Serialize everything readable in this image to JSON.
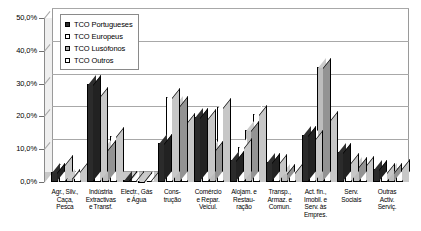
{
  "chart_data": {
    "type": "bar",
    "title": "",
    "xlabel": "",
    "ylabel": "",
    "ylim": [
      0,
      50
    ],
    "ytick_labels": [
      "50,0%",
      "40,0%",
      "30,0%",
      "20,0%",
      "10,0%",
      "0,0%"
    ],
    "ytick_values": [
      50,
      40,
      30,
      20,
      10,
      0
    ],
    "grid": true,
    "legend_position": "upper-left-inside",
    "style": "3d-clustered-column",
    "categories": [
      "Agr., Silv., Caça, Pesca",
      "Indústria Extractivas e Transf.",
      "Electr., Gás e Água",
      "Cons-trução",
      "Comércio e Repar. Veicul.",
      "Alojam. e Restau-ração",
      "Transp., Armaz. e Comun.",
      "Act. fin., Imobil. e Serv. às Empres.",
      "Serv. Sociais",
      "Outras Activ. Serviç."
    ],
    "category_lines": [
      [
        "Agr., Silv.,",
        "Caça,",
        "Pesca"
      ],
      [
        "Indústria",
        "Extractivas",
        "e Transf."
      ],
      [
        "Electr., Gás",
        "e Água"
      ],
      [
        "Cons-",
        "trução"
      ],
      [
        "Comércio",
        "e Repar.",
        "Veicul."
      ],
      [
        "Alojam. e",
        "Restau-",
        "ração"
      ],
      [
        "Transp.,",
        "Armaz. e",
        "Comun."
      ],
      [
        "Act. fin.,",
        "Imobil. e",
        "Serv. às",
        "Empres."
      ],
      [
        "Serv.",
        "Sociais"
      ],
      [
        "Outras",
        "Activ.",
        "Serviç."
      ]
    ],
    "series": [
      {
        "name": "TCO Portugueses",
        "color": "#2b2b2b",
        "values": [
          3.2,
          30.0,
          0.6,
          11.8,
          19.8,
          6.8,
          6.0,
          14.2,
          9.0,
          4.0
        ]
      },
      {
        "name": "TCO Europeus",
        "color": "#ffffff",
        "values": [
          5.6,
          26.2,
          0.5,
          25.8,
          19.6,
          10.8,
          5.8,
          13.0,
          6.0,
          3.2
        ]
      },
      {
        "name": "TCO Lusófonos",
        "color": "#bdbdbd",
        "values": [
          1.2,
          10.2,
          0.4,
          23.4,
          9.8,
          15.8,
          2.8,
          35.2,
          5.0,
          3.0
        ]
      },
      {
        "name": "TCO Outros",
        "color": "#ffffff",
        "values": [
          3.4,
          14.0,
          0.5,
          18.2,
          22.8,
          20.8,
          3.0,
          19.0,
          5.2,
          4.2
        ]
      }
    ]
  },
  "legend": {
    "items": [
      {
        "label": "TCO Portugueses"
      },
      {
        "label": "TCO Europeus"
      },
      {
        "label": "TCO Lusófonos"
      },
      {
        "label": "TCO Outros"
      }
    ]
  }
}
